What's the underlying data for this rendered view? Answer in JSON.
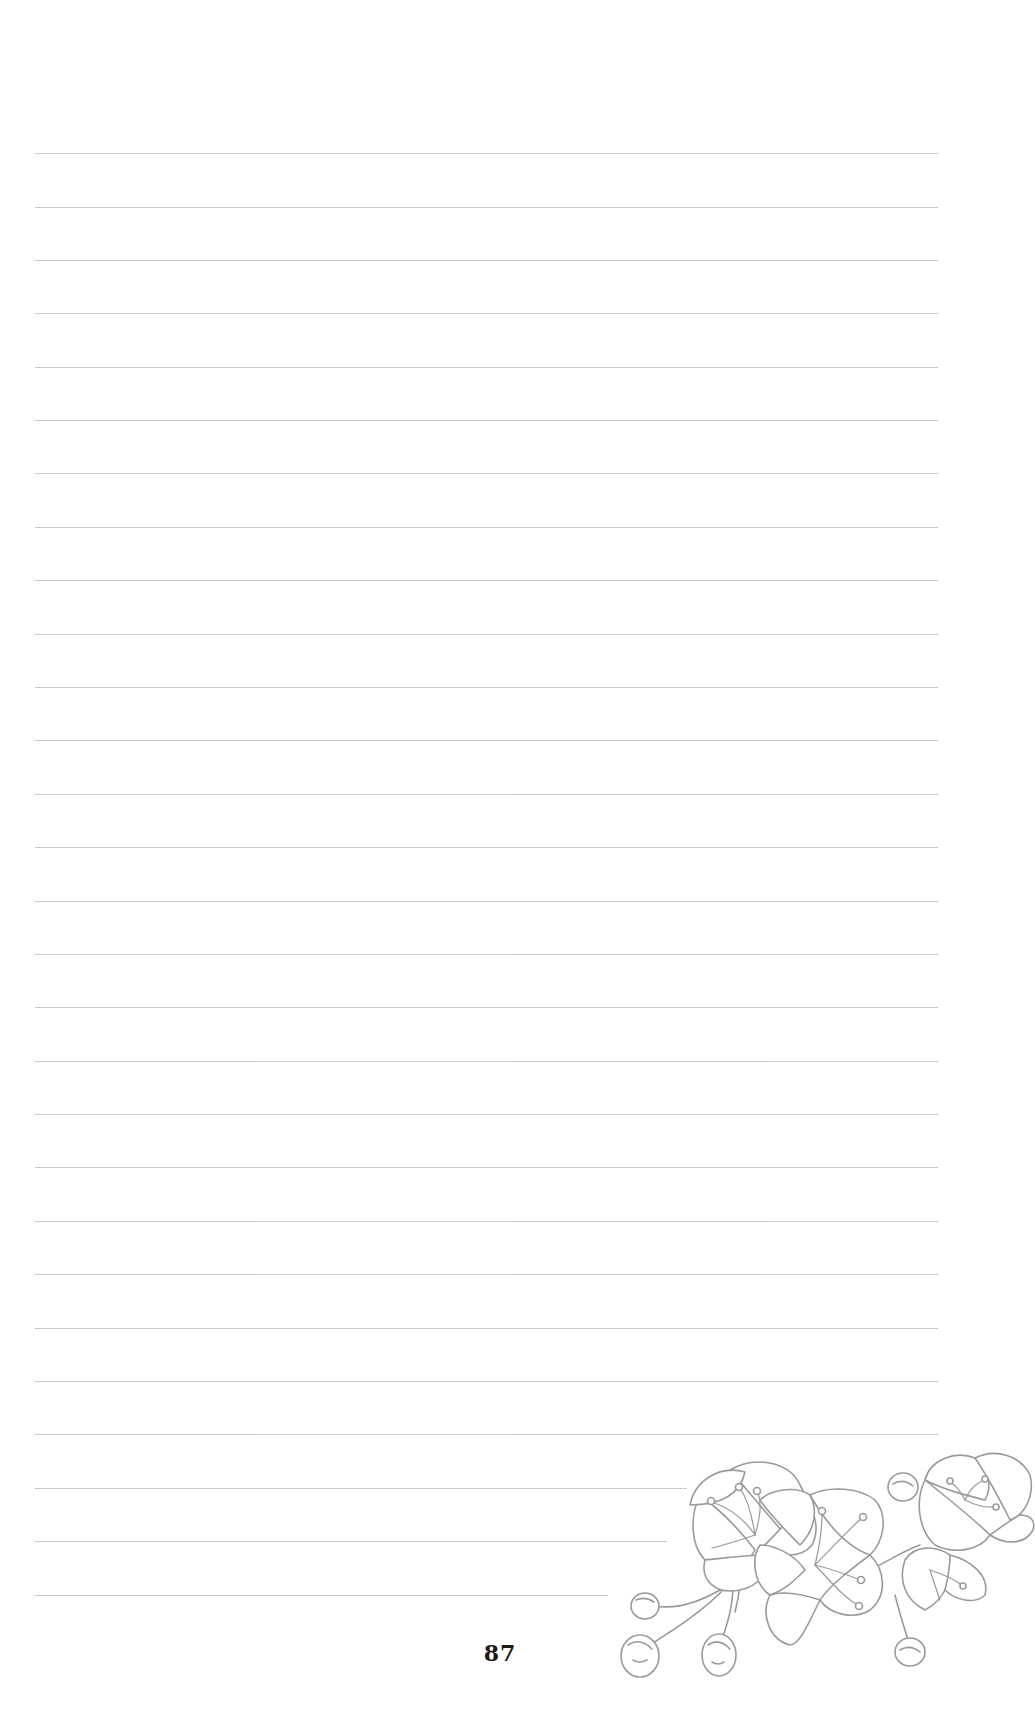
{
  "page": {
    "type": "lined-notebook-page",
    "background_color": "#ffffff",
    "rule_color": "#c4c4c4",
    "page_number": "87",
    "page_number_color": "#1a1a1a"
  },
  "rules": [
    {
      "y": 153,
      "x_start": 35,
      "x_end": 938
    },
    {
      "y": 207,
      "x_start": 35,
      "x_end": 938
    },
    {
      "y": 260,
      "x_start": 35,
      "x_end": 938
    },
    {
      "y": 313,
      "x_start": 35,
      "x_end": 938
    },
    {
      "y": 367,
      "x_start": 35,
      "x_end": 938
    },
    {
      "y": 420,
      "x_start": 35,
      "x_end": 938
    },
    {
      "y": 473,
      "x_start": 35,
      "x_end": 938
    },
    {
      "y": 527,
      "x_start": 35,
      "x_end": 938
    },
    {
      "y": 580,
      "x_start": 35,
      "x_end": 938
    },
    {
      "y": 634,
      "x_start": 35,
      "x_end": 938
    },
    {
      "y": 687,
      "x_start": 35,
      "x_end": 938
    },
    {
      "y": 740,
      "x_start": 35,
      "x_end": 938
    },
    {
      "y": 794,
      "x_start": 35,
      "x_end": 938
    },
    {
      "y": 847,
      "x_start": 35,
      "x_end": 938
    },
    {
      "y": 901,
      "x_start": 35,
      "x_end": 938
    },
    {
      "y": 954,
      "x_start": 35,
      "x_end": 938
    },
    {
      "y": 1007,
      "x_start": 35,
      "x_end": 938
    },
    {
      "y": 1061,
      "x_start": 35,
      "x_end": 938
    },
    {
      "y": 1114,
      "x_start": 35,
      "x_end": 938
    },
    {
      "y": 1167,
      "x_start": 35,
      "x_end": 938
    },
    {
      "y": 1221,
      "x_start": 35,
      "x_end": 938
    },
    {
      "y": 1274,
      "x_start": 35,
      "x_end": 938
    },
    {
      "y": 1328,
      "x_start": 35,
      "x_end": 938
    },
    {
      "y": 1381,
      "x_start": 35,
      "x_end": 938
    },
    {
      "y": 1434,
      "x_start": 35,
      "x_end": 938
    },
    {
      "y": 1488,
      "x_start": 35,
      "x_end": 687
    },
    {
      "y": 1541,
      "x_start": 35,
      "x_end": 667
    },
    {
      "y": 1595,
      "x_start": 35,
      "x_end": 608
    }
  ],
  "illustration": {
    "subject": "flowering-branch-sketch",
    "stroke_color": "#9a9a9a",
    "position": "bottom-right"
  }
}
